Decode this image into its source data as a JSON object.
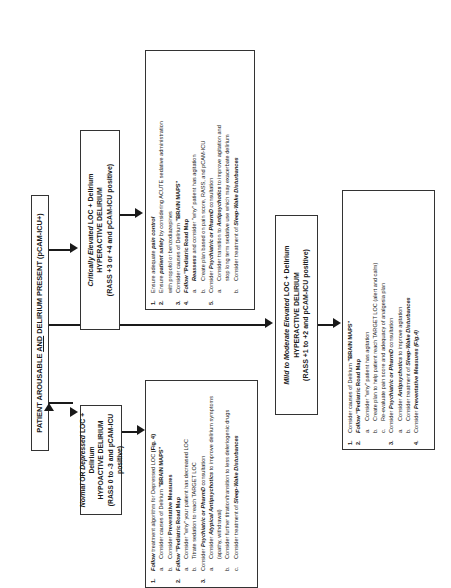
{
  "main_box": {
    "pre": "PATIENT AROUSABLE ",
    "and": "AND",
    "post": " DELIRIUM PRESENT (pCAM-ICU+)"
  },
  "hypoactive": {
    "header": {
      "line1_a": "Normal",
      "line1_b": " OR ",
      "line1_c": "Depressed",
      "line1_d": " LOC + Delirium",
      "line2": "HYPOACTIVE DELIRIUM",
      "line3": "(RASS 0 to -3 and pCAM-ICU positive)"
    },
    "items": [
      {
        "num": "1.",
        "a": "Follow",
        "b": " treatment algorithm for Depressed LOC ",
        "c": "(Fig. 4)",
        "subs": [
          {
            "let": "a.",
            "text": "Consider causes of Delirium ",
            "bold": "\"BRAIN MAPS\""
          },
          {
            "let": "b.",
            "text": "Consider ",
            "bold": "Preventative Measures"
          }
        ]
      },
      {
        "num": "2.",
        "a": "Follow",
        "b": " \"Pediatric Road Map",
        "subs": [
          {
            "let": "a.",
            "text": "Consider \"why\" your patient has decreased LOC"
          },
          {
            "let": "b.",
            "text": "Titrate sedation to reach TARGET LOC"
          }
        ]
      },
      {
        "num": "3.",
        "a": "Consider ",
        "b": "Psychiatric or PharmD",
        "c": " consultation",
        "subs": [
          {
            "let": "a.",
            "text": "Consider ",
            "bold": "Atypical Antipsychotics",
            "after": " to improve delirium symptoms",
            "cont": "(apathy, withdrawal)"
          },
          {
            "let": "b.",
            "text": "Consider further titration/transition to less deleriogenic drugs"
          },
          {
            "let": "c.",
            "text": "Consider treatment of ",
            "bold": "Sleep-Wake Disturbances"
          }
        ]
      }
    ]
  },
  "critical": {
    "header": {
      "line1_a": "Critically Elevated",
      "line1_b": " LOC + Delirium",
      "line2": "HYPERACTIVE DELIRIUM",
      "line3": "(RASS +3 or +4 and pCAM-ICU positive)"
    },
    "items": [
      {
        "num": "1.",
        "text": "Ensure adequate ",
        "bold": "pain control"
      },
      {
        "num": "2.",
        "text": "Ensure ",
        "bold": "patient safety",
        "after": " by considering ACUTE sedative administration",
        "cont": "with propofol or benzodiazepines"
      },
      {
        "num": "3.",
        "text": "Consider causes of Delirium ",
        "bold": "\"BRAIN MAPS\""
      },
      {
        "num": "4.",
        "lead": "Follow",
        "text": " \"Pediatric Road Map",
        "subs": [
          {
            "let": "a.",
            "bold": "Reassess",
            "text": " and consider \"why\" patient has agitation"
          },
          {
            "let": "b.",
            "text": "Create plan based on pain score, RASS, and pCAM-ICU"
          }
        ]
      },
      {
        "num": "5.",
        "text": "Consider ",
        "bold": "Psychiatric or PharmD",
        "after": " consultation",
        "subs": [
          {
            "let": "a.",
            "text": "Consider transition to ",
            "bold": "Antipsychotics",
            "after": " to improve agitation and",
            "cont": "stop long term sedative use which may exacerbate delirium"
          },
          {
            "let": "b.",
            "text": "Consider treatment of ",
            "bold": "Sleep-Wake Disturbances"
          }
        ]
      }
    ]
  },
  "mild": {
    "header": {
      "line1_a": "Mild to Moderate ",
      "line1_b": "Elevated",
      "line1_c": " LOC + Delirium",
      "line2": "HYPERACTIVE DELIRIUM",
      "line3": "(RASS +1 to +2 and pCAM-ICU positive)"
    },
    "items": [
      {
        "num": "1.",
        "text": "Consider causes of Delirium ",
        "bold": "\"BRAIN MAPS\""
      },
      {
        "num": "2.",
        "lead": "Follow",
        "text": " \"Pediatric Road Map",
        "subs": [
          {
            "let": "a.",
            "text": "Consider \"why\" patient has agitation"
          },
          {
            "let": "b.",
            "text": "Create plan to help patient reach TARGET LOC (alert and calm)"
          },
          {
            "let": "c.",
            "text": "Re-evaluate pain score and adequacy of analgesia plan"
          }
        ]
      },
      {
        "num": "3.",
        "text": "Consider ",
        "bold": "Psychiatric or PharmD",
        "after": " consultation",
        "subs": [
          {
            "let": "a.",
            "text": "Consider ",
            "bold": "Antipsychotics",
            "after": " to improve agitation"
          },
          {
            "let": "b.",
            "text": "Consider treatment of ",
            "bold": "Sleep-Wake Disturbances"
          }
        ]
      },
      {
        "num": "4.",
        "text": "Consider ",
        "bold": "Preventative Measures (Fig.4)"
      }
    ]
  }
}
